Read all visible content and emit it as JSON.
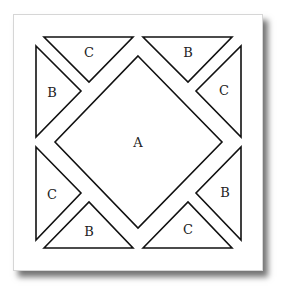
{
  "diagram": {
    "type": "quilt-block-pattern",
    "center": {
      "label": "A"
    },
    "triangles": [
      {
        "position": "top-left-top",
        "label": "C"
      },
      {
        "position": "top-left-left",
        "label": "B"
      },
      {
        "position": "top-right-top",
        "label": "B"
      },
      {
        "position": "top-right-right",
        "label": "C"
      },
      {
        "position": "bottom-left-left",
        "label": "C"
      },
      {
        "position": "bottom-left-bottom",
        "label": "B"
      },
      {
        "position": "bottom-right-right",
        "label": "B"
      },
      {
        "position": "bottom-right-bottom",
        "label": "C"
      }
    ],
    "colors": {
      "stroke": "#111111",
      "fill": "#ffffff",
      "shadow": "#555555"
    }
  }
}
